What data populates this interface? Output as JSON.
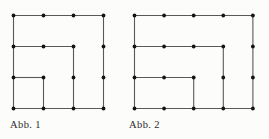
{
  "figures": [
    {
      "label": "Abb. 1",
      "grid": {
        "cols": 4,
        "rows": 4
      },
      "dots": "all-grid-intersections",
      "edges": [
        {
          "from": [
            0,
            0
          ],
          "to": [
            3,
            0
          ]
        },
        {
          "from": [
            0,
            0
          ],
          "to": [
            0,
            3
          ]
        },
        {
          "from": [
            0,
            3
          ],
          "to": [
            3,
            3
          ]
        },
        {
          "from": [
            3,
            0
          ],
          "to": [
            3,
            3
          ]
        },
        {
          "from": [
            0,
            1
          ],
          "to": [
            2,
            1
          ]
        },
        {
          "from": [
            2,
            1
          ],
          "to": [
            2,
            3
          ]
        },
        {
          "from": [
            0,
            2
          ],
          "to": [
            1,
            2
          ]
        },
        {
          "from": [
            1,
            2
          ],
          "to": [
            1,
            3
          ]
        }
      ]
    },
    {
      "label": "Abb. 2",
      "grid": {
        "cols": 5,
        "rows": 4
      },
      "dots": "all-grid-intersections",
      "edges": [
        {
          "from": [
            0,
            0
          ],
          "to": [
            4,
            0
          ]
        },
        {
          "from": [
            0,
            0
          ],
          "to": [
            0,
            3
          ]
        },
        {
          "from": [
            0,
            3
          ],
          "to": [
            4,
            3
          ]
        },
        {
          "from": [
            4,
            0
          ],
          "to": [
            4,
            3
          ]
        },
        {
          "from": [
            0,
            1
          ],
          "to": [
            3,
            1
          ]
        },
        {
          "from": [
            3,
            1
          ],
          "to": [
            3,
            3
          ]
        },
        {
          "from": [
            0,
            2
          ],
          "to": [
            2,
            2
          ]
        },
        {
          "from": [
            2,
            2
          ],
          "to": [
            2,
            3
          ]
        }
      ]
    }
  ],
  "colors": {
    "line": "#595959",
    "dot": "#141414",
    "label": "#2b2b2b",
    "background": "#fcfcfb"
  }
}
